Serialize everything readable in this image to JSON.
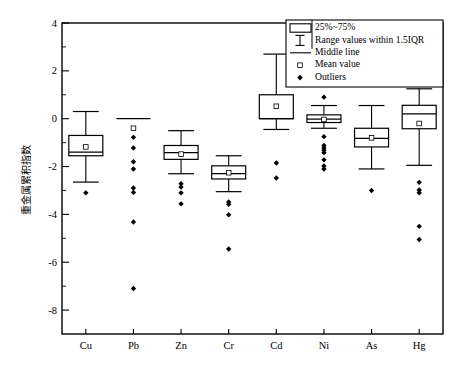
{
  "chart_data": {
    "type": "box",
    "title": "",
    "xlabel": "",
    "ylabel": "重金属累积指数",
    "ylim": [
      -9,
      4
    ],
    "yticks": [
      4,
      2,
      0,
      -2,
      -4,
      -6,
      -8
    ],
    "ytick_labels": [
      "4",
      "2",
      "0",
      "-2",
      "-4",
      "-6",
      "-8"
    ],
    "minor_ticks": true,
    "grid": false,
    "legend_position": "top-right",
    "categories": [
      "Cu",
      "Pb",
      "Zn",
      "Cr",
      "Cd",
      "Ni",
      "As",
      "Hg"
    ],
    "legend": {
      "entries": [
        {
          "symbol": "box",
          "label": "25%~75%"
        },
        {
          "symbol": "whisker",
          "label": "Range values within 1.5IQR"
        },
        {
          "symbol": "line",
          "label": "Middle line"
        },
        {
          "symbol": "open-square",
          "label": "Mean value"
        },
        {
          "symbol": "filled-diamond",
          "label": "Outliers"
        }
      ]
    },
    "series": [
      {
        "name": "Cu",
        "whisker_low": -2.65,
        "q1": -1.55,
        "median": -1.4,
        "q3": -0.7,
        "whisker_high": 0.3,
        "mean": -1.18,
        "outliers": [
          -3.1
        ]
      },
      {
        "name": "Pb",
        "whisker_low": 0.0,
        "q1": 0.0,
        "median": 0.0,
        "q3": 0.0,
        "whisker_high": 0.0,
        "mean": -0.4,
        "outliers": [
          -0.78,
          -1.22,
          -1.8,
          -2.1,
          -2.9,
          -3.08,
          -4.32,
          -7.1
        ]
      },
      {
        "name": "Zn",
        "whisker_low": -2.3,
        "q1": -1.7,
        "median": -1.42,
        "q3": -1.12,
        "whisker_high": -0.5,
        "mean": -1.48,
        "outliers": [
          -2.72,
          -2.86,
          -3.1,
          -3.56
        ]
      },
      {
        "name": "Cr",
        "whisker_low": -3.05,
        "q1": -2.52,
        "median": -2.3,
        "q3": -1.97,
        "whisker_high": -1.55,
        "mean": -2.26,
        "outliers": [
          -3.48,
          -3.58,
          -4.02,
          -5.45
        ]
      },
      {
        "name": "Cd",
        "whisker_low": -0.45,
        "q1": 0.0,
        "median": 0.0,
        "q3": 1.0,
        "whisker_high": 2.7,
        "mean": 0.52,
        "outliers": [
          -1.85,
          -2.48
        ]
      },
      {
        "name": "Ni",
        "whisker_low": -0.4,
        "q1": -0.16,
        "median": -0.02,
        "q3": 0.16,
        "whisker_high": 0.55,
        "mean": -0.03,
        "outliers": [
          0.9,
          -0.75,
          -1.12,
          -1.22,
          -1.32,
          -1.42,
          -1.72,
          -1.98,
          -2.1
        ]
      },
      {
        "name": "As",
        "whisker_low": -2.1,
        "q1": -1.18,
        "median": -0.82,
        "q3": -0.4,
        "whisker_high": 0.55,
        "mean": -0.8,
        "outliers": [
          -3.0
        ]
      },
      {
        "name": "Hg",
        "whisker_low": -1.95,
        "q1": -0.42,
        "median": 0.2,
        "q3": 0.56,
        "whisker_high": 1.25,
        "mean": -0.2,
        "outliers": [
          -2.66,
          -2.98,
          -3.1,
          -4.5,
          -5.05
        ]
      }
    ]
  },
  "colors": {
    "stroke": "#000000",
    "fill": "#ffffff",
    "background": "#ffffff"
  }
}
